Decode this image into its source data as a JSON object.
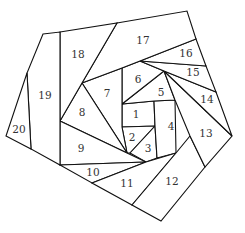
{
  "title": "",
  "pieces": [
    {
      "id": "1",
      "label": "1"
    },
    {
      "id": "2",
      "label": "2"
    },
    {
      "id": "3",
      "label": "3"
    },
    {
      "id": "4",
      "label": "4"
    },
    {
      "id": "5",
      "label": "5"
    },
    {
      "id": "6",
      "label": "6"
    },
    {
      "id": "7",
      "label": "7"
    },
    {
      "id": "8",
      "label": "8"
    },
    {
      "id": "9",
      "label": "9"
    },
    {
      "id": "10",
      "label": "10"
    },
    {
      "id": "11",
      "label": "11"
    },
    {
      "id": "12",
      "label": "12"
    },
    {
      "id": "13",
      "label": "13"
    },
    {
      "id": "14",
      "label": "14"
    },
    {
      "id": "15",
      "label": "15"
    },
    {
      "id": "16",
      "label": "16"
    },
    {
      "id": "17",
      "label": "17"
    },
    {
      "id": "18",
      "label": "18"
    },
    {
      "id": "19",
      "label": "19"
    },
    {
      "id": "20",
      "label": "20"
    }
  ],
  "colors": {
    "stroke": "#111111",
    "fill": "#ffffff",
    "label": "#333333"
  }
}
